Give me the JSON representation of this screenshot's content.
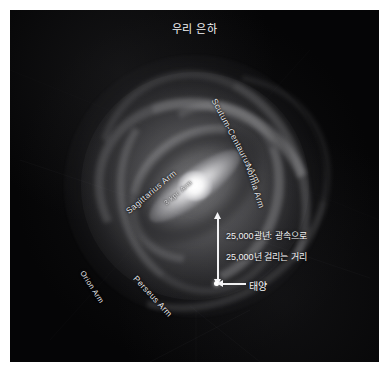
{
  "figure": {
    "title": "우리 은하",
    "background_color": "#000000",
    "page_background": "#ffffff",
    "palette": {
      "star_white": "#ffffff",
      "label_text": "#e9e9ec",
      "annotation_text": "#f4f4f6",
      "space": "#050506"
    }
  },
  "arm_labels": [
    {
      "name": "scutum-centaurus-arm",
      "text": "Scutum-Centaurus Arm",
      "x": 204,
      "y": 84,
      "rotation": 62
    },
    {
      "name": "norma-arm",
      "text": "Norma Arm",
      "x": 238,
      "y": 149,
      "rotation": 72
    },
    {
      "name": "sagittarius-arm",
      "text": "Sagittarius Arm",
      "x": 117,
      "y": 197,
      "rotation": -40
    },
    {
      "name": "three-kpc-arm",
      "text": "3 kpc Arm",
      "x": 155,
      "y": 190,
      "rotation": -40
    },
    {
      "name": "perseus-arm",
      "text": "Perseus Arm",
      "x": 125,
      "y": 262,
      "rotation": 47
    },
    {
      "name": "orion-arm",
      "text": "Orion Arm",
      "x": 72,
      "y": 257,
      "rotation": 57
    }
  ],
  "annotation": {
    "distance_line_1": "25,000광년: 광속으로",
    "distance_line_2": "25,000년 걸리는 거리",
    "sun_label": "태양"
  }
}
